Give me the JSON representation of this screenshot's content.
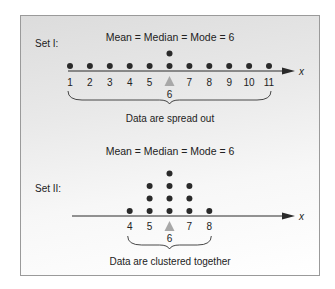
{
  "chart_data": [
    {
      "type": "scatter",
      "title": "Mean = Median = Mode = 6",
      "set_label": "Set I:",
      "xlabel": "x",
      "tick_labels": [
        "1",
        "2",
        "3",
        "4",
        "5",
        "6",
        "7",
        "8",
        "9",
        "10",
        "11"
      ],
      "points": [
        {
          "x": 1,
          "count": 1
        },
        {
          "x": 2,
          "count": 1
        },
        {
          "x": 3,
          "count": 1
        },
        {
          "x": 4,
          "count": 1
        },
        {
          "x": 5,
          "count": 1
        },
        {
          "x": 6,
          "count": 2
        },
        {
          "x": 7,
          "count": 1
        },
        {
          "x": 8,
          "count": 1
        },
        {
          "x": 9,
          "count": 1
        },
        {
          "x": 10,
          "count": 1
        },
        {
          "x": 11,
          "count": 1
        }
      ],
      "center_marker": "6",
      "annotation": "Data are spread out"
    },
    {
      "type": "scatter",
      "title": "Mean = Median = Mode = 6",
      "set_label": "Set II:",
      "xlabel": "x",
      "tick_labels": [
        "4",
        "5",
        "6",
        "7",
        "8"
      ],
      "points": [
        {
          "x": 4,
          "count": 1
        },
        {
          "x": 5,
          "count": 3
        },
        {
          "x": 6,
          "count": 4
        },
        {
          "x": 7,
          "count": 3
        },
        {
          "x": 8,
          "count": 1
        }
      ],
      "center_marker": "6",
      "annotation": "Data are clustered together"
    }
  ],
  "colors": {
    "dot": "#2a2a2a",
    "axis": "#2a2a2a",
    "triangle": "#a8a8a8",
    "border": "#9a9a9a"
  }
}
